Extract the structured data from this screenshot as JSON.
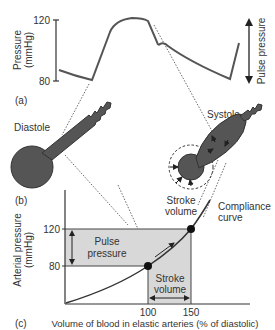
{
  "panel_a": {
    "label": "(a)",
    "y_axis_label_line1": "Pressure",
    "y_axis_label_line2": "(mmHg)",
    "tick_high": "120",
    "tick_low": "80",
    "right_label": "Pulse pressure"
  },
  "panel_b": {
    "label": "(b)",
    "diastole_label": "Diastole",
    "systole_label": "Systole",
    "stroke_label_line1": "Stroke",
    "stroke_label_line2": "volume"
  },
  "panel_c": {
    "label": "(c)",
    "y_axis_label_line1": "Arterial pressure",
    "y_axis_label_line2": "(mmHg)",
    "tick_high": "120",
    "tick_low": "80",
    "x_tick_1": "100",
    "x_tick_2": "150",
    "x_axis_label": "Volume of blood in elastic arteries (% of diastolic)",
    "pulse_label_line1": "Pulse",
    "pulse_label_line2": "pressure",
    "stroke_label_line1": "Stroke",
    "stroke_label_line2": "volume",
    "curve_label_line1": "Compliance",
    "curve_label_line2": "curve"
  },
  "colors": {
    "ink": "#3a3a3a",
    "vessel_fill": "#555555",
    "shade": "#d8d8d8",
    "text": "#333333"
  }
}
